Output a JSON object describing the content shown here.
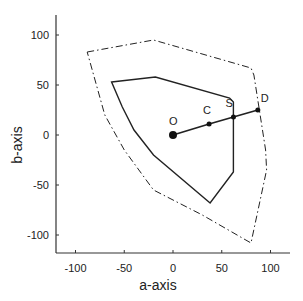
{
  "chart_data": {
    "type": "line",
    "title": "",
    "xlabel": "a-axis",
    "ylabel": "b-axis",
    "xlim": [
      -120,
      120
    ],
    "ylim": [
      -120,
      120
    ],
    "xticks": [
      -100,
      -50,
      0,
      50,
      100
    ],
    "yticks": [
      -100,
      -50,
      0,
      50,
      100
    ],
    "grid": false,
    "legend": null,
    "series": [
      {
        "name": "outer gamut boundary",
        "style": "dash-dot",
        "closed": false,
        "points": [
          [
            -88,
            83
          ],
          [
            -20,
            95
          ],
          [
            80,
            67
          ],
          [
            83,
            60
          ],
          [
            95,
            -15
          ],
          [
            96,
            -35
          ],
          [
            80,
            -108
          ],
          [
            30,
            -80
          ],
          [
            -20,
            -55
          ],
          [
            -50,
            -15
          ],
          [
            -70,
            20
          ],
          [
            -88,
            83
          ]
        ]
      },
      {
        "name": "inner gamut boundary",
        "style": "solid",
        "closed": true,
        "points": [
          [
            -63,
            53
          ],
          [
            -18,
            58
          ],
          [
            58,
            37
          ],
          [
            62,
            33
          ],
          [
            62,
            -37
          ],
          [
            38,
            -68
          ],
          [
            -20,
            -20
          ],
          [
            -40,
            5
          ],
          [
            -52,
            28
          ],
          [
            -63,
            53
          ]
        ]
      },
      {
        "name": "mapping line O-D",
        "style": "solid",
        "points": [
          [
            0,
            0
          ],
          [
            37,
            11
          ],
          [
            62,
            18
          ],
          [
            87,
            25
          ]
        ]
      }
    ],
    "annotations": [
      {
        "label": "O",
        "x": 0,
        "y": 0
      },
      {
        "label": "C",
        "x": 37,
        "y": 11
      },
      {
        "label": "S",
        "x": 62,
        "y": 18
      },
      {
        "label": "D",
        "x": 87,
        "y": 25
      }
    ]
  },
  "axes": {
    "x_label": "a-axis",
    "y_label": "b-axis",
    "x_tick_labels": [
      "-100",
      "-50",
      "0",
      "50",
      "100"
    ],
    "y_tick_labels": [
      "100",
      "50",
      "0",
      "-50",
      "-100"
    ]
  }
}
